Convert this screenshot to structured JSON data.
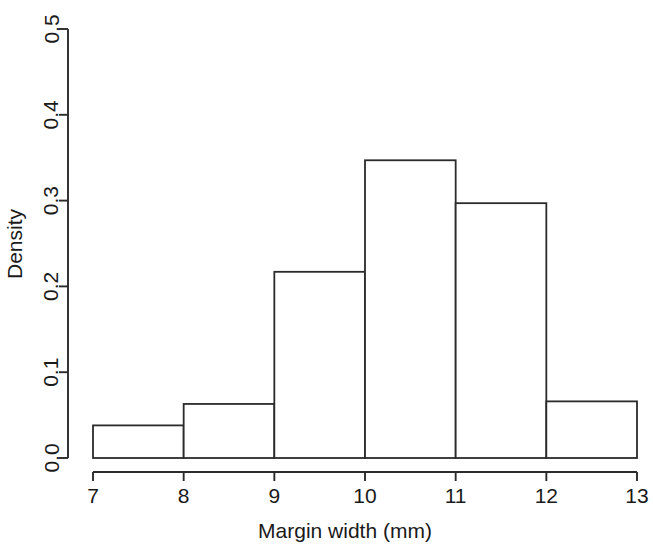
{
  "chart_data": {
    "type": "bar",
    "title": "",
    "subtitle": "",
    "xlabel": "Margin width (mm)",
    "ylabel": "Density",
    "xlim": [
      7,
      13
    ],
    "ylim": [
      0.0,
      0.5
    ],
    "grid": false,
    "legend": null,
    "bin_edges": [
      7,
      8,
      9,
      10,
      11,
      12,
      13
    ],
    "categories": [
      "7-8",
      "8-9",
      "9-10",
      "10-11",
      "11-12",
      "12-13"
    ],
    "values": [
      0.038,
      0.063,
      0.217,
      0.347,
      0.297,
      0.066
    ],
    "bars": [
      {
        "x0": 7,
        "x1": 8,
        "density": 0.038
      },
      {
        "x0": 8,
        "x1": 9,
        "density": 0.063
      },
      {
        "x0": 9,
        "x1": 10,
        "density": 0.217
      },
      {
        "x0": 10,
        "x1": 11,
        "density": 0.347
      },
      {
        "x0": 11,
        "x1": 12,
        "density": 0.297
      },
      {
        "x0": 12,
        "x1": 13,
        "density": 0.066
      }
    ],
    "x_ticks": [
      {
        "value": 7,
        "label": "7"
      },
      {
        "value": 8,
        "label": "8"
      },
      {
        "value": 9,
        "label": "9"
      },
      {
        "value": 10,
        "label": "10"
      },
      {
        "value": 11,
        "label": "11"
      },
      {
        "value": 12,
        "label": "12"
      },
      {
        "value": 13,
        "label": "13"
      }
    ],
    "y_ticks": [
      {
        "value": 0.0,
        "label": "0.0"
      },
      {
        "value": 0.1,
        "label": "0.1"
      },
      {
        "value": 0.2,
        "label": "0.2"
      },
      {
        "value": 0.3,
        "label": "0.3"
      },
      {
        "value": 0.4,
        "label": "0.4"
      },
      {
        "value": 0.5,
        "label": "0.5"
      }
    ],
    "colors": {
      "background": "#ffffff",
      "axis": "#2b2b2b",
      "bar_stroke": "#2b2b2b",
      "bar_fill": "#ffffff",
      "text": "#1a1a1a"
    }
  }
}
